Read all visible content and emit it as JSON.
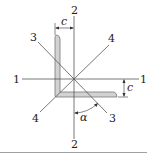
{
  "diagram": {
    "axis_labels": {
      "axis1_left": "1",
      "axis1_right": "1",
      "axis2_top": "2",
      "axis2_bottom": "2",
      "axis3_top": "3",
      "axis3_bottom": "3",
      "axis4_top": "4",
      "axis4_bottom": "4"
    },
    "dimensions": {
      "c_horizontal": "c",
      "c_vertical": "c"
    },
    "angle_label": "α",
    "colors": {
      "line": "#555555",
      "section_fill": "#d0d0d0",
      "section_stroke": "#666666",
      "rule": "#888888"
    }
  }
}
